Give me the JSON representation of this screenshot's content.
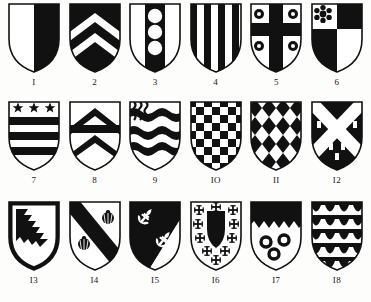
{
  "plate": {
    "title": "Heraldic Shields Plate",
    "background_color": "#fdfdfb",
    "tincture_dark": "#111111",
    "tincture_light": "#ffffff",
    "outline_color": "#111111",
    "rows": 3,
    "columns": 6,
    "total_shields": 18
  },
  "shields": [
    {
      "number": "1",
      "caption": "I",
      "blazon": "Per pale argent and sable",
      "pattern": "per-pale",
      "charges": []
    },
    {
      "number": "2",
      "caption": "2",
      "blazon": "Sable, two chevrons argent",
      "pattern": "chevrons-on-sable",
      "charges": [
        "chevron",
        "chevron"
      ]
    },
    {
      "number": "3",
      "caption": "3",
      "blazon": "Argent, a pale sable charged with three roundels argent",
      "pattern": "pale-with-roundels",
      "charges": [
        "roundel",
        "roundel",
        "roundel"
      ]
    },
    {
      "number": "4",
      "caption": "4",
      "blazon": "Paly of eight sable and argent",
      "pattern": "paly",
      "charges": []
    },
    {
      "number": "5",
      "caption": "5",
      "blazon": "Argent, a cross sable between four roundels sable each charged with a point argent",
      "pattern": "cross-with-roundels",
      "charges": [
        "roundel",
        "roundel",
        "roundel",
        "roundel"
      ]
    },
    {
      "number": "6",
      "caption": "6",
      "blazon": "Quarterly argent and sable, in the first quarter a cinquefoil sable",
      "pattern": "quarterly-with-rosette",
      "charges": [
        "rosette"
      ]
    },
    {
      "number": "7",
      "caption": "7",
      "blazon": "Argent, on a chief sable three mullets sable, two bars sable",
      "pattern": "bars-with-stars",
      "charges": [
        "mullet",
        "mullet",
        "mullet"
      ]
    },
    {
      "number": "8",
      "caption": "8",
      "blazon": "Argent, two chevrons and a fess sable",
      "pattern": "chevrons-and-fess",
      "charges": []
    },
    {
      "number": "9",
      "caption": "9",
      "blazon": "Barry wavy sable and argent, a canton paly wavy",
      "pattern": "barry-wavy",
      "charges": []
    },
    {
      "number": "10",
      "caption": "IO",
      "blazon": "Checky sable and argent",
      "pattern": "checky",
      "charges": []
    },
    {
      "number": "11",
      "caption": "II",
      "blazon": "Lozengy sable and argent",
      "pattern": "lozengy",
      "charges": []
    },
    {
      "number": "12",
      "caption": "I2",
      "blazon": "Sable, a saltire argent between billets argent",
      "pattern": "saltire-with-billets",
      "charges": [
        "billet",
        "billet",
        "billet",
        "billet",
        "billet",
        "billet",
        "billet",
        "billet"
      ]
    },
    {
      "number": "13",
      "caption": "I3",
      "blazon": "Argent, a bend dancetty sable within a bordure sable",
      "pattern": "bend-dancetty-bordure",
      "charges": []
    },
    {
      "number": "14",
      "caption": "I4",
      "blazon": "Argent, a bend sable between two escallops sable",
      "pattern": "bend-with-escallops",
      "charges": [
        "escallop",
        "escallop"
      ]
    },
    {
      "number": "15",
      "caption": "I5",
      "blazon": "Per bend sable and argent, two fleurs-de-lis countercharged",
      "pattern": "per-bend-fleurs",
      "charges": [
        "fleur-de-lis",
        "fleur-de-lis"
      ]
    },
    {
      "number": "16",
      "caption": "I6",
      "blazon": "Argent, an inescutcheon sable between ten crosses crosslet sable",
      "pattern": "inescutcheon-with-crosslets",
      "charges": [
        "cross-crosslet",
        "cross-crosslet",
        "cross-crosslet",
        "cross-crosslet",
        "cross-crosslet",
        "cross-crosslet",
        "cross-crosslet",
        "cross-crosslet",
        "cross-crosslet",
        "cross-crosslet"
      ]
    },
    {
      "number": "17",
      "caption": "I7",
      "blazon": "Argent, a chief dancetty sable, three annulets sable",
      "pattern": "chief-dancetty-annulets",
      "charges": [
        "annulet",
        "annulet",
        "annulet"
      ]
    },
    {
      "number": "18",
      "caption": "I8",
      "blazon": "Vairy sable and argent of five rows",
      "pattern": "vair-rows",
      "charges": []
    }
  ]
}
